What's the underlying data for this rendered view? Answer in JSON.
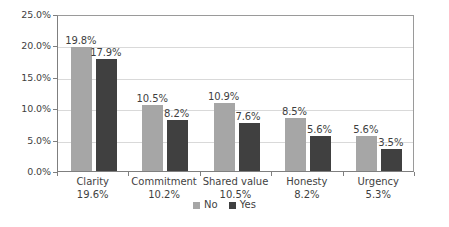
{
  "chart_data": {
    "type": "bar",
    "title": "",
    "subtitle": "",
    "xlabel": "",
    "ylabel": "",
    "ylim": [
      0,
      25
    ],
    "grid": true,
    "legend_position": "bottom",
    "categories": [
      "Clarity",
      "Commitment",
      "Shared value",
      "Honesty",
      "Urgency"
    ],
    "category_totals": [
      "19.6%",
      "10.2%",
      "10.5%",
      "8.2%",
      "5.3%"
    ],
    "ytick_labels": [
      "0.0%",
      "5.0%",
      "10.0%",
      "15.0%",
      "20.0%",
      "25.0%"
    ],
    "ytick_values": [
      0,
      5,
      10,
      15,
      20,
      25
    ],
    "series": [
      {
        "name": "No",
        "color": "#a6a6a6",
        "values": [
          19.8,
          10.5,
          10.9,
          8.5,
          5.6
        ],
        "labels": [
          "19.8%",
          "10.5%",
          "10.9%",
          "8.5%",
          "5.6%"
        ]
      },
      {
        "name": "Yes",
        "color": "#404040",
        "values": [
          17.9,
          8.2,
          7.6,
          5.6,
          3.5
        ],
        "labels": [
          "17.9%",
          "8.2%",
          "7.6%",
          "5.6%",
          "3.5%"
        ]
      }
    ]
  },
  "legend": {
    "items": [
      {
        "label": "No",
        "color": "#a6a6a6"
      },
      {
        "label": "Yes",
        "color": "#404040"
      }
    ]
  },
  "axes": {
    "y": {
      "ticks": [
        {
          "label": "25.0%",
          "value": 25
        },
        {
          "label": "20.0%",
          "value": 20
        },
        {
          "label": "15.0%",
          "value": 15
        },
        {
          "label": "10.0%",
          "value": 10
        },
        {
          "label": "5.0%",
          "value": 5
        },
        {
          "label": "0.0%",
          "value": 0
        }
      ]
    }
  }
}
